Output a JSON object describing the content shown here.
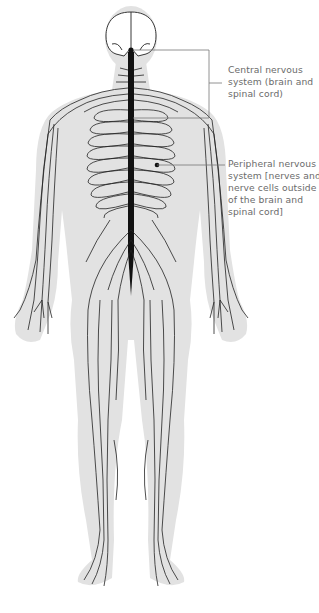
{
  "figure": {
    "colors": {
      "silhouette": "#e2e2e2",
      "nerves": "#1a1a1a",
      "leader_lines": "#777777",
      "label_text": "#6b6b6b"
    }
  },
  "labels": [
    {
      "id": "central-nervous-system",
      "lines": [
        "Central nervous",
        "system (brain and",
        "spinal cord)"
      ]
    },
    {
      "id": "peripheral-nervous-system",
      "lines": [
        "Peripheral nervous",
        "system [nerves and",
        "nerve cells outside",
        "of the brain and",
        "spinal cord]"
      ]
    }
  ]
}
